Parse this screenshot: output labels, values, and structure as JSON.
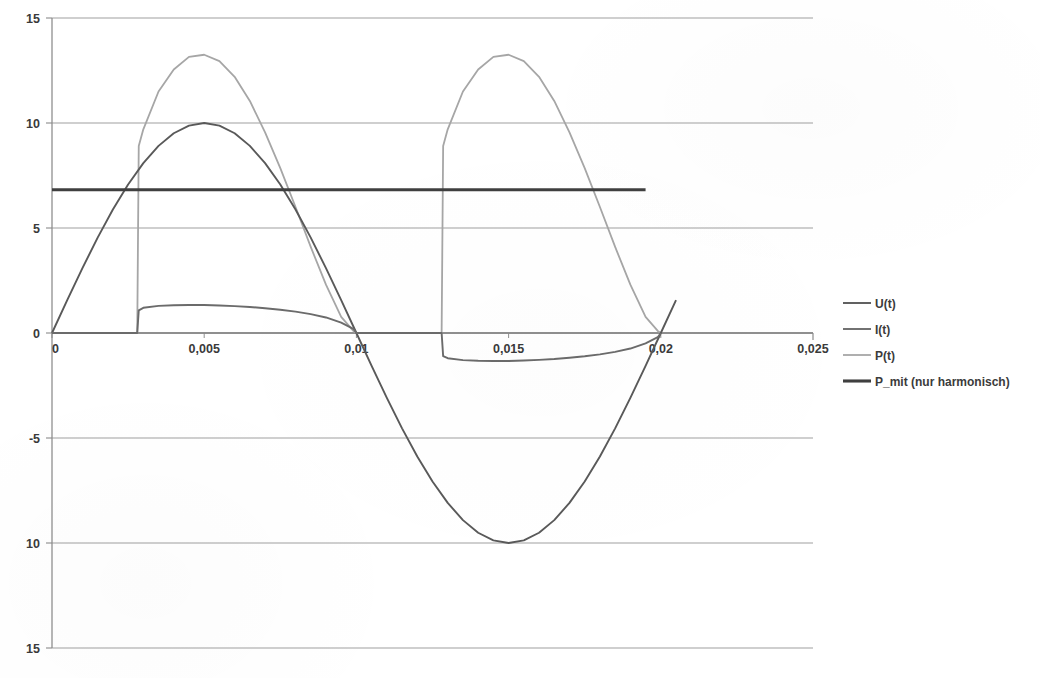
{
  "chart_data": {
    "type": "line",
    "title": "",
    "subtitle": "",
    "xlabel": "",
    "ylabel": "",
    "xlim": [
      0,
      0.025
    ],
    "ylim": [
      -15,
      15
    ],
    "grid": true,
    "legend_position": "right",
    "x_ticks": [
      "0",
      "0,005",
      "0,01",
      "0,015",
      "0,02",
      "0,025"
    ],
    "x_tick_values": [
      0,
      0.005,
      0.01,
      0.015,
      0.02,
      0.025
    ],
    "y_ticks": [
      "15",
      "10",
      "5",
      "0",
      "-5",
      "10",
      "15"
    ],
    "y_tick_values": [
      15,
      10,
      5,
      0,
      -5,
      -10,
      -15
    ],
    "legend": [
      {
        "name": "U(t)",
        "color": "#595959"
      },
      {
        "name": "I(t)",
        "color": "#6b6b6b"
      },
      {
        "name": "P(t)",
        "color": "#a6a6a6"
      },
      {
        "name": "P_mit (nur harmonisch)",
        "color": "#3f3f3f"
      }
    ],
    "series": [
      {
        "name": "U(t)",
        "color": "#595959",
        "width": 1.9,
        "description": "Sinusspannung, Amplitude 10, Periode 0,02 s",
        "x": [
          0,
          0.0005,
          0.001,
          0.0015,
          0.002,
          0.0025,
          0.003,
          0.0035,
          0.004,
          0.0045,
          0.005,
          0.0055,
          0.006,
          0.0065,
          0.007,
          0.0075,
          0.008,
          0.0085,
          0.009,
          0.0095,
          0.01,
          0.0105,
          0.011,
          0.0115,
          0.012,
          0.0125,
          0.013,
          0.0135,
          0.014,
          0.0145,
          0.015,
          0.0155,
          0.016,
          0.0165,
          0.017,
          0.0175,
          0.018,
          0.0185,
          0.019,
          0.0195,
          0.02,
          0.0205
        ],
        "y": [
          0,
          1.564,
          3.09,
          4.54,
          5.878,
          7.071,
          8.09,
          8.91,
          9.511,
          9.877,
          10,
          9.877,
          9.511,
          8.91,
          8.09,
          7.071,
          5.878,
          4.54,
          3.09,
          1.564,
          0,
          -1.564,
          -3.09,
          -4.54,
          -5.878,
          -7.071,
          -8.09,
          -8.91,
          -9.511,
          -9.877,
          -10,
          -9.877,
          -9.511,
          -8.91,
          -8.09,
          -7.071,
          -5.878,
          -4.54,
          -3.09,
          -1.564,
          0,
          1.564
        ]
      },
      {
        "name": "I(t)",
        "color": "#6b6b6b",
        "width": 1.9,
        "description": "Phasenangeschnittener Strom, Zuendwinkel bei t = 0,0029 s, Amplitude ca. 1,3",
        "x": [
          0,
          0.0005,
          0.001,
          0.0015,
          0.002,
          0.0025,
          0.0028,
          0.00285,
          0.003,
          0.0035,
          0.004,
          0.0045,
          0.005,
          0.0055,
          0.006,
          0.0065,
          0.007,
          0.0075,
          0.008,
          0.0085,
          0.009,
          0.0095,
          0.0099,
          0.01,
          0.0105,
          0.011,
          0.0115,
          0.012,
          0.0125,
          0.0128,
          0.01285,
          0.013,
          0.0135,
          0.014,
          0.0145,
          0.015,
          0.0155,
          0.016,
          0.0165,
          0.017,
          0.0175,
          0.018,
          0.0185,
          0.019,
          0.0195,
          0.0199,
          0.02
        ],
        "y": [
          0,
          0,
          0,
          0,
          0,
          0,
          0,
          1.08,
          1.2,
          1.29,
          1.32,
          1.33,
          1.33,
          1.31,
          1.28,
          1.24,
          1.18,
          1.11,
          1.02,
          0.9,
          0.74,
          0.49,
          0.2,
          0,
          0,
          0,
          0,
          0,
          0,
          0,
          -1.1,
          -1.2,
          -1.29,
          -1.32,
          -1.33,
          -1.33,
          -1.31,
          -1.28,
          -1.24,
          -1.18,
          -1.11,
          -1.02,
          -0.9,
          -0.74,
          -0.49,
          -0.2,
          0
        ]
      },
      {
        "name": "P(t)",
        "color": "#a6a6a6",
        "width": 1.8,
        "description": "Momentanleistung u*i, rein positiv, Spitzenwert ca. 13,2",
        "x": [
          0,
          0.0005,
          0.001,
          0.0015,
          0.002,
          0.0025,
          0.0028,
          0.00285,
          0.003,
          0.0035,
          0.004,
          0.0045,
          0.005,
          0.0055,
          0.006,
          0.0065,
          0.007,
          0.0075,
          0.008,
          0.0085,
          0.009,
          0.0095,
          0.0099,
          0.01,
          0.0105,
          0.011,
          0.0115,
          0.012,
          0.0125,
          0.0128,
          0.01285,
          0.013,
          0.0135,
          0.014,
          0.0145,
          0.015,
          0.0155,
          0.016,
          0.0165,
          0.017,
          0.0175,
          0.018,
          0.0185,
          0.019,
          0.0195,
          0.0199,
          0.02
        ],
        "y": [
          0,
          0,
          0,
          0,
          0,
          0,
          0,
          8.9,
          9.7,
          11.5,
          12.55,
          13.15,
          13.25,
          12.95,
          12.2,
          11.05,
          9.55,
          7.85,
          6.0,
          4.1,
          2.3,
          0.77,
          0.1,
          0,
          0,
          0,
          0,
          0,
          0,
          0,
          8.9,
          9.7,
          11.5,
          12.55,
          13.15,
          13.25,
          12.95,
          12.2,
          11.05,
          9.55,
          7.85,
          6.0,
          4.1,
          2.3,
          0.77,
          0.1,
          0
        ]
      },
      {
        "name": "P_mit (nur harmonisch)",
        "color": "#3f3f3f",
        "width": 3.1,
        "description": "Konstante mittlere Wirkleistung der Grundschwingung",
        "constant": 6.82,
        "x": [
          0,
          0.0195
        ],
        "y": [
          6.82,
          6.82
        ]
      }
    ]
  },
  "axes": {
    "y_axis_name": "value-axis",
    "x_axis_name": "time-axis"
  }
}
